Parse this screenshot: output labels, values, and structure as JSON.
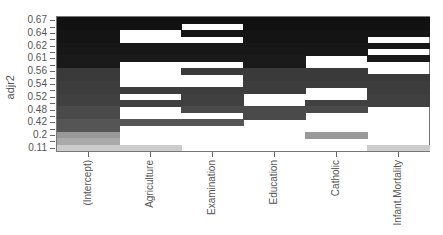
{
  "chart_data": {
    "type": "heatmap",
    "title": "",
    "xlabel": "",
    "ylabel": "adjr2",
    "x_categories": [
      "(Intercept)",
      "Agriculture",
      "Examination",
      "Education",
      "Catholic",
      "Infant.Mortality"
    ],
    "y_tick_labels_top_to_bottom": [
      "0.67",
      "0.64",
      "0.62",
      "0.61",
      "0.56",
      "0.54",
      "0.52",
      "0.48",
      "0.42",
      "0.2",
      "0.11"
    ],
    "rows_top_to_bottom": [
      {
        "adjr2": "0.67",
        "shade": "#111111",
        "included": [
          1,
          1,
          1,
          1,
          1,
          1
        ]
      },
      {
        "adjr2": "",
        "shade": "#111111",
        "included": [
          1,
          1,
          0,
          1,
          1,
          1
        ]
      },
      {
        "adjr2": "0.64",
        "shade": "#141414",
        "included": [
          1,
          0,
          1,
          1,
          1,
          1
        ]
      },
      {
        "adjr2": "",
        "shade": "#141414",
        "included": [
          1,
          0,
          0,
          1,
          1,
          0
        ]
      },
      {
        "adjr2": "0.62",
        "shade": "#171717",
        "included": [
          1,
          1,
          1,
          1,
          1,
          1
        ]
      },
      {
        "adjr2": "",
        "shade": "#171717",
        "included": [
          1,
          1,
          1,
          1,
          1,
          0
        ]
      },
      {
        "adjr2": "0.61",
        "shade": "#1a1a1a",
        "included": [
          1,
          1,
          1,
          1,
          0,
          1
        ]
      },
      {
        "adjr2": "",
        "shade": "#1a1a1a",
        "included": [
          1,
          0,
          0,
          1,
          0,
          0
        ]
      },
      {
        "adjr2": "0.56",
        "shade": "#3a3a3a",
        "included": [
          1,
          0,
          1,
          1,
          1,
          0
        ]
      },
      {
        "adjr2": "",
        "shade": "#3a3a3a",
        "included": [
          1,
          0,
          0,
          1,
          1,
          1
        ]
      },
      {
        "adjr2": "0.54",
        "shade": "#3d3d3d",
        "included": [
          1,
          0,
          0,
          1,
          1,
          1
        ]
      },
      {
        "adjr2": "",
        "shade": "#3d3d3d",
        "included": [
          1,
          1,
          1,
          1,
          0,
          1
        ]
      },
      {
        "adjr2": "0.52",
        "shade": "#404040",
        "included": [
          1,
          0,
          1,
          0,
          0,
          1
        ]
      },
      {
        "adjr2": "",
        "shade": "#404040",
        "included": [
          1,
          1,
          1,
          0,
          1,
          1
        ]
      },
      {
        "adjr2": "0.48",
        "shade": "#4a4a4a",
        "included": [
          1,
          0,
          1,
          1,
          1,
          0
        ]
      },
      {
        "adjr2": "",
        "shade": "#4a4a4a",
        "included": [
          1,
          0,
          0,
          1,
          0,
          0
        ]
      },
      {
        "adjr2": "0.42",
        "shade": "#555555",
        "included": [
          1,
          1,
          1,
          0,
          0,
          0
        ]
      },
      {
        "adjr2": "",
        "shade": "#555555",
        "included": [
          1,
          0,
          0,
          0,
          0,
          0
        ]
      },
      {
        "adjr2": "0.2",
        "shade": "#999999",
        "included": [
          1,
          0,
          0,
          0,
          1,
          0
        ]
      },
      {
        "adjr2": "",
        "shade": "#aaaaaa",
        "included": [
          1,
          0,
          0,
          0,
          0,
          0
        ]
      },
      {
        "adjr2": "0.11",
        "shade": "#cccccc",
        "included": [
          1,
          1,
          0,
          0,
          0,
          1
        ]
      }
    ],
    "grid": false,
    "legend": "none"
  }
}
